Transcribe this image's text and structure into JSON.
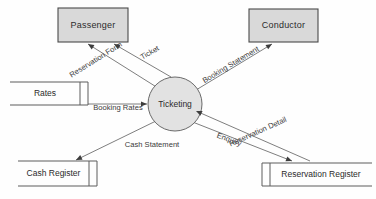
{
  "diagram": {
    "type": "data-flow-diagram",
    "canvas": {
      "width": 376,
      "height": 199,
      "background": "#fefefe"
    },
    "colors": {
      "entity_fill": "#d9d9d9",
      "entity_stroke": "#4a4a4a",
      "process_fill": "#e2e2e2",
      "process_stroke": "#6a6a6a",
      "store_stroke": "#5d5d5d",
      "flow_stroke": "#6f6f6f",
      "arrow_fill": "#3d3d3d",
      "text": "#2b2b2b"
    }
  },
  "entities": [
    {
      "id": "passenger",
      "label": "Passenger",
      "x": 58,
      "y": 8,
      "w": 70,
      "h": 34
    },
    {
      "id": "conductor",
      "label": "Conductor",
      "x": 249,
      "y": 9,
      "w": 69,
      "h": 33
    }
  ],
  "process": {
    "id": "ticketing",
    "label": "Ticketing",
    "cx": 175,
    "cy": 104,
    "r": 27
  },
  "stores": [
    {
      "id": "rates",
      "label": "Rates",
      "x": 10,
      "y": 82,
      "w": 78,
      "h": 23,
      "divider": "right"
    },
    {
      "id": "cash-register",
      "label": "Cash Register",
      "x": 18,
      "y": 161,
      "w": 79,
      "h": 25,
      "divider": "right"
    },
    {
      "id": "reservation-register",
      "label": "Reservation Register",
      "x": 262,
      "y": 163,
      "w": 110,
      "h": 23,
      "divider": "left"
    }
  ],
  "flows": [
    {
      "id": "reservation-form",
      "label": "Reservation Form",
      "from": "ticketing",
      "to": "passenger",
      "x1": 158,
      "y1": 88,
      "x2": 88,
      "y2": 44,
      "label_x": 96,
      "label_y": 60,
      "rotate": -32,
      "anchor": "middle"
    },
    {
      "id": "ticket",
      "label": "Ticket",
      "from": "ticketing",
      "to": "passenger",
      "x1": 171,
      "y1": 77,
      "x2": 114,
      "y2": 44,
      "label_x": 150,
      "label_y": 53,
      "rotate": -30,
      "anchor": "middle"
    },
    {
      "id": "booking-rates",
      "label": "Booking Rates",
      "from": "rates",
      "to": "ticketing",
      "x1": 88,
      "y1": 104,
      "x2": 147,
      "y2": 104,
      "label_x": 118,
      "label_y": 108,
      "rotate": 0,
      "anchor": "middle"
    },
    {
      "id": "booking-statement",
      "label": "Booking Statement",
      "from": "ticketing",
      "to": "conductor",
      "x1": 196,
      "y1": 90,
      "x2": 272,
      "y2": 44,
      "label_x": 231,
      "label_y": 65,
      "rotate": -31,
      "anchor": "middle"
    },
    {
      "id": "reservation-detail",
      "label": "Reservation Detail",
      "from": "reservation-register",
      "to": "ticketing",
      "x1": 310,
      "y1": 161,
      "x2": 196,
      "y2": 111,
      "label_x": 258,
      "label_y": 132,
      "rotate": -24,
      "anchor": "middle"
    },
    {
      "id": "enquiry",
      "label": "Enquiry",
      "from": "ticketing",
      "to": "reservation-register",
      "x1": 190,
      "y1": 121,
      "x2": 292,
      "y2": 161,
      "label_x": 229,
      "label_y": 140,
      "rotate": 21,
      "anchor": "middle"
    },
    {
      "id": "cash-statement",
      "label": "Cash Statement",
      "from": "ticketing",
      "to": "cash-register",
      "x1": 158,
      "y1": 120,
      "x2": 76,
      "y2": 160,
      "label_x": 152,
      "label_y": 145,
      "rotate": 0,
      "anchor": "middle"
    }
  ]
}
